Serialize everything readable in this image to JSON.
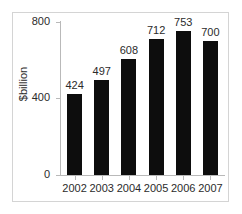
{
  "chart_data": {
    "type": "bar",
    "title": "",
    "subtitle": "",
    "xlabel": "",
    "ylabel": "$billion",
    "categories": [
      "2002",
      "2003",
      "2004",
      "2005",
      "2006",
      "2007"
    ],
    "values": [
      424,
      497,
      608,
      712,
      753,
      700
    ],
    "value_labels": [
      "424",
      "497",
      "608",
      "712",
      "753",
      "700"
    ],
    "ylim": [
      0,
      800
    ],
    "yticks": [
      0,
      400,
      800
    ],
    "ytick_labels": [
      "0",
      "400",
      "800"
    ],
    "grid": false,
    "legend": null,
    "legend_position": "none",
    "bar_color": "#0d0d0d",
    "axis_color": "#b9b9b9",
    "text_color": "#2b2b2b",
    "frame_color": "#d4d4d4",
    "background": "#ffffff"
  }
}
